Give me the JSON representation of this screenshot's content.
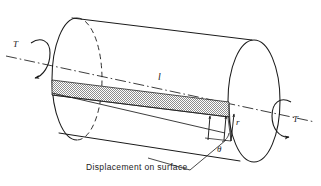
{
  "figure": {
    "background_color": "#ffffff",
    "line_color": "#1a1a1a",
    "shade_color": "#9a9a9a",
    "width": 321,
    "height": 186
  },
  "labels": {
    "torque_left": "T",
    "torque_right": "T",
    "length": "l",
    "radius": "r",
    "angle": "θ",
    "caption": "Displacement on surface"
  },
  "elements": {
    "cylinder_name": "circular shaft",
    "axis_name": "centerline axis",
    "shaded_band_name": "displaced surface element",
    "left_face_name": "near end face",
    "right_face_name": "far end face",
    "torque_arrow_left_name": "applied torque arrow left",
    "torque_arrow_right_name": "applied torque arrow right",
    "leader_name": "caption leader line"
  },
  "geometry": {
    "left_face_center": [
      77,
      79
    ],
    "left_face_rx": 25,
    "left_face_ry": 61,
    "right_face_center": [
      254,
      101
    ],
    "right_face_rx": 26,
    "right_face_ry": 61,
    "axis_start": [
      6,
      56
    ],
    "axis_end": [
      315,
      122
    ],
    "band_top_left": [
      52,
      80
    ],
    "band_top_right": [
      229,
      102
    ],
    "band_bottom_right": [
      229,
      117
    ],
    "band_bottom_left": [
      52,
      95
    ]
  }
}
